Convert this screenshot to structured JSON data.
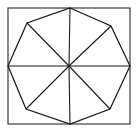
{
  "figure": {
    "name": "octagon-inscribed-in-square",
    "background_color": "#ffffff",
    "canvas": {
      "width": 138,
      "height": 132
    }
  },
  "square": {
    "name": "outer-square-frame",
    "stroke_color": "#2b2b2b",
    "stroke_width": 1.1,
    "fill": "none",
    "x": 8,
    "y": 8,
    "width": 122,
    "height": 116,
    "corners": [
      {
        "label": "top-left",
        "x": 8,
        "y": 8
      },
      {
        "label": "top-right",
        "x": 130,
        "y": 8
      },
      {
        "label": "bottom-right",
        "x": 130,
        "y": 124
      },
      {
        "label": "bottom-left",
        "x": 8,
        "y": 124
      }
    ]
  },
  "octagon": {
    "name": "inscribed-octagon",
    "sides": 8,
    "stroke_color": "#1a1a1a",
    "stroke_width": 1.25,
    "fill": "none",
    "vertices": [
      {
        "label": "top",
        "x": 70,
        "y": 8
      },
      {
        "label": "top-right",
        "x": 111,
        "y": 26
      },
      {
        "label": "right",
        "x": 130,
        "y": 66
      },
      {
        "label": "bottom-right",
        "x": 110,
        "y": 109
      },
      {
        "label": "bottom",
        "x": 70,
        "y": 124
      },
      {
        "label": "bottom-left",
        "x": 26,
        "y": 109
      },
      {
        "label": "left",
        "x": 8,
        "y": 66
      },
      {
        "label": "top-left",
        "x": 27,
        "y": 23
      }
    ],
    "points_string": "70,8 111,26 130,66 110,109 70,124 26,109 8,66 27,23"
  },
  "center": {
    "name": "octagon-center-point",
    "x": 69,
    "y": 66
  },
  "radii": {
    "name": "center-radii",
    "count": 8,
    "stroke_color": "#1a1a1a",
    "stroke_width": 1.1,
    "segments": [
      {
        "label": "radius-to-top",
        "x1": 69,
        "y1": 66,
        "x2": 70,
        "y2": 8
      },
      {
        "label": "radius-to-top-right",
        "x1": 69,
        "y1": 66,
        "x2": 111,
        "y2": 26
      },
      {
        "label": "radius-to-right",
        "x1": 69,
        "y1": 66,
        "x2": 130,
        "y2": 66
      },
      {
        "label": "radius-to-bottom-right",
        "x1": 69,
        "y1": 66,
        "x2": 110,
        "y2": 109
      },
      {
        "label": "radius-to-bottom",
        "x1": 69,
        "y1": 66,
        "x2": 70,
        "y2": 124
      },
      {
        "label": "radius-to-bottom-left",
        "x1": 69,
        "y1": 66,
        "x2": 26,
        "y2": 109
      },
      {
        "label": "radius-to-left",
        "x1": 69,
        "y1": 66,
        "x2": 8,
        "y2": 66
      },
      {
        "label": "radius-to-top-left",
        "x1": 69,
        "y1": 66,
        "x2": 27,
        "y2": 23
      }
    ]
  }
}
